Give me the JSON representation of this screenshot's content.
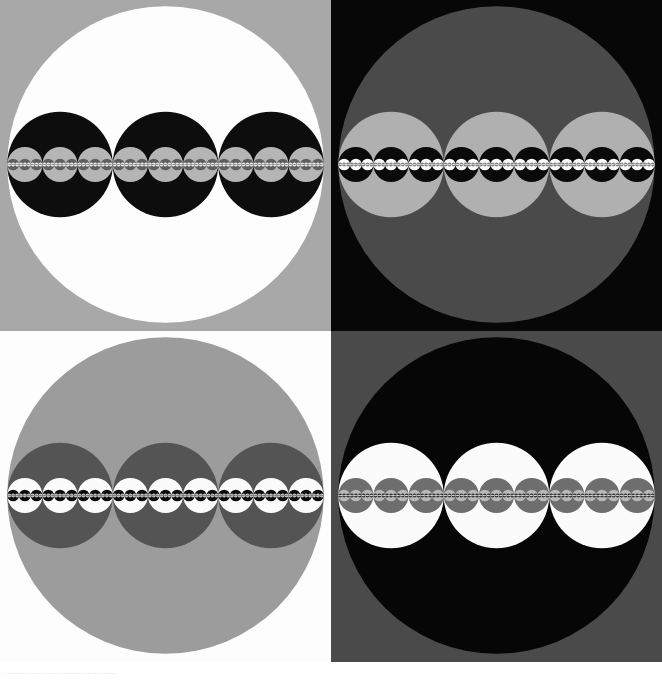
{
  "figure": {
    "width": 662,
    "height": 680,
    "page_background": "#ffffff",
    "caption_text": "...................................."
  },
  "chart_data": {
    "type": "diagram",
    "recursion": {
      "children_per_circle": 3,
      "child_radius_ratio": 0.3333333,
      "child_offsets_in_parent_radii": [
        -0.6666667,
        0,
        0.6666667
      ],
      "depth": 5,
      "orientation": "horizontal"
    },
    "grid": {
      "rows": 2,
      "columns": 2,
      "panel_size_px": 331
    },
    "palette": {
      "white": "#ffffff",
      "light_gray": "#c8c8c8",
      "medium_gray": "#9a9a9a",
      "dark_gray": "#5a5a5a",
      "darker_gray": "#3a3a3a",
      "black": "#080808"
    },
    "panels": [
      {
        "id": "panel-top-left",
        "position": "top-left",
        "background_color": "#a8a8a8",
        "disc_color": "#fdfdfd",
        "level_colors": [
          "#fdfdfd",
          "#0d0d0d",
          "#b5b5b5",
          "#5e5e5e",
          "#f2f2f2",
          "#8a8a8a"
        ],
        "label": "Top left panel"
      },
      {
        "id": "panel-top-right",
        "position": "top-right",
        "background_color": "#070707",
        "disc_color": "#4a4a4a",
        "level_colors": [
          "#4a4a4a",
          "#b0b0b0",
          "#0a0a0a",
          "#fbfbfb",
          "#7d7d7d",
          "#d8d8d8"
        ],
        "label": "Top right panel"
      },
      {
        "id": "panel-bottom-left",
        "position": "bottom-left",
        "background_color": "#fdfdfd",
        "disc_color": "#9c9c9c",
        "level_colors": [
          "#9c9c9c",
          "#545454",
          "#fbfbfb",
          "#0c0c0c",
          "#c6c6c6",
          "#787878"
        ],
        "label": "Bottom left panel"
      },
      {
        "id": "panel-bottom-right",
        "position": "bottom-right",
        "background_color": "#4a4a4a",
        "disc_color": "#060606",
        "level_colors": [
          "#060606",
          "#fbfbfb",
          "#6e6e6e",
          "#b8b8b8",
          "#2a2a2a",
          "#dedede"
        ],
        "label": "Bottom right panel"
      }
    ]
  },
  "panels_ui": {
    "top_left_name": "panel-top-left",
    "top_right_name": "panel-top-right",
    "bottom_left_name": "panel-bottom-left",
    "bottom_right_name": "panel-bottom-right"
  }
}
